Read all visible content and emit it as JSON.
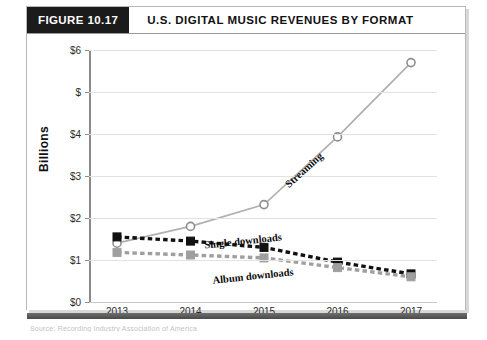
{
  "figure": {
    "badge": "FIGURE 10.17",
    "title": "U.S. DIGITAL MUSIC REVENUES BY FORMAT"
  },
  "chart_data": {
    "type": "line",
    "title": "U.S. DIGITAL MUSIC REVENUES BY FORMAT",
    "xlabel": "",
    "ylabel": "Billions",
    "x": [
      2013,
      2014,
      2015,
      2016,
      2017
    ],
    "xtick_labels": [
      "2013",
      "2014",
      "2015",
      "2016",
      "2017"
    ],
    "ytick_labels": [
      "$0",
      "$1",
      "$2",
      "$3",
      "$4",
      "$",
      "$6"
    ],
    "ytick_values": [
      0,
      1,
      2,
      3,
      4,
      5,
      6
    ],
    "ylim": [
      0,
      6
    ],
    "grid": true,
    "legend_position": "inline-annotations",
    "series": [
      {
        "name": "Streaming",
        "values": [
          1.4,
          1.8,
          2.32,
          3.93,
          5.7
        ],
        "color": "#b0b0b0",
        "style": "solid",
        "marker": "circle"
      },
      {
        "name": "Single downloads",
        "values": [
          1.55,
          1.45,
          1.3,
          0.95,
          0.67
        ],
        "color": "#111111",
        "style": "dashed",
        "marker": "square"
      },
      {
        "name": "Album downloads",
        "values": [
          1.18,
          1.12,
          1.05,
          0.82,
          0.6
        ],
        "color": "#9f9f9f",
        "style": "dashed",
        "marker": "square"
      }
    ],
    "annotations": [
      {
        "text": "Streaming",
        "x": 2015.55,
        "y": 3.15,
        "rotation": -42
      },
      {
        "text": "Single downloads",
        "x": 2014.72,
        "y": 1.46,
        "rotation": -6
      },
      {
        "text": "Album downloads",
        "x": 2014.85,
        "y": 0.62,
        "rotation": -6
      }
    ]
  },
  "caption": {
    "text": "Source: Recording Industry Association of America"
  }
}
